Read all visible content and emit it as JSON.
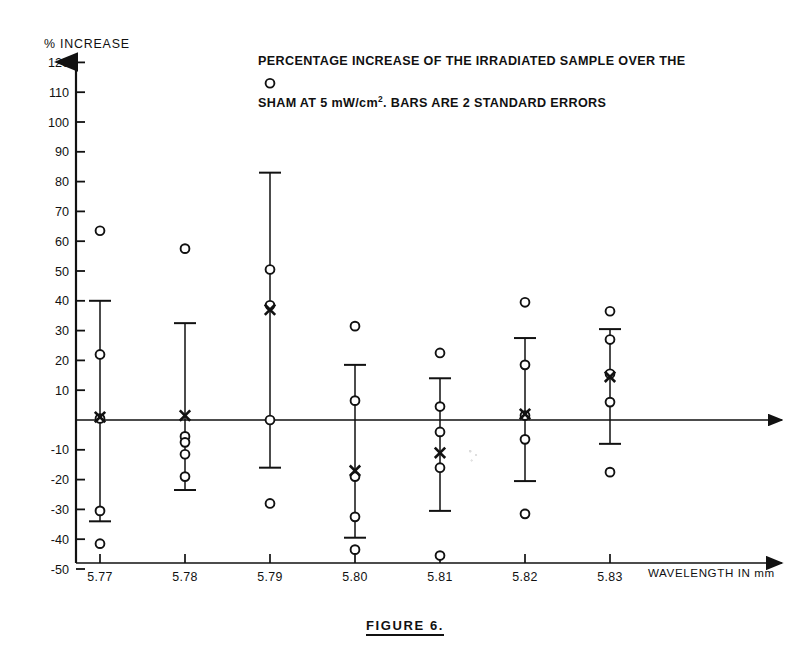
{
  "title": {
    "line1": "PERCENTAGE INCREASE OF THE IRRADIATED SAMPLE OVER THE",
    "line2_pre": "SHAM AT 5 mW/cm",
    "line2_sup": "2",
    "line2_post": ".   BARS ARE 2 STANDARD ERRORS"
  },
  "caption": "FIGURE 6.",
  "axis": {
    "y_label": "% INCREASE",
    "x_label": "WAVELENGTH IN mm"
  },
  "chart_data": {
    "type": "scatter",
    "title": "PERCENTAGE INCREASE OF THE IRRADIATED SAMPLE OVER THE SHAM AT 5 mW/cm2. BARS ARE 2 STANDARD ERRORS",
    "xlabel": "WAVELENGTH IN mm",
    "ylabel": "% INCREASE",
    "categories": [
      "5.77",
      "5.78",
      "5.79",
      "5.80",
      "5.81",
      "5.82",
      "5.83"
    ],
    "ylim": [
      -50,
      120
    ],
    "yticks": [
      120,
      110,
      100,
      90,
      80,
      70,
      60,
      50,
      40,
      30,
      20,
      10,
      0,
      -10,
      -20,
      -30,
      -40,
      -50
    ],
    "ytick_labels": [
      "120",
      "110",
      "100",
      "90",
      "80",
      "70",
      "60",
      "50",
      "40",
      "30",
      "20",
      "10",
      "",
      "-10",
      "-20",
      "-30",
      "-40",
      "-50"
    ],
    "grid": false,
    "legend": false,
    "zero_line": 0,
    "marker_note": "open circles = individual observations; X = mean; vertical bar with caps = 2 standard errors",
    "groups": [
      {
        "x": "5.77",
        "mean": 1.0,
        "err_low": -34.0,
        "err_high": 40.0,
        "points": [
          63.5,
          22.0,
          0.5,
          -30.5,
          -41.5
        ]
      },
      {
        "x": "5.78",
        "mean": 1.5,
        "err_low": -23.5,
        "err_high": 32.5,
        "points": [
          57.5,
          -5.5,
          -7.5,
          -11.5,
          -19.0
        ]
      },
      {
        "x": "5.79",
        "mean": 37.0,
        "err_low": -16.0,
        "err_high": 83.0,
        "points": [
          113.0,
          50.5,
          38.5,
          0.0,
          -28.0
        ]
      },
      {
        "x": "5.80",
        "mean": -17.0,
        "err_low": -39.5,
        "err_high": 18.5,
        "points": [
          31.5,
          6.5,
          -19.0,
          -32.5,
          -43.5
        ]
      },
      {
        "x": "5.81",
        "mean": -11.0,
        "err_low": -30.5,
        "err_high": 14.0,
        "points": [
          22.5,
          4.5,
          -4.0,
          -16.0,
          -45.5
        ]
      },
      {
        "x": "5.82",
        "mean": 2.0,
        "err_low": -20.5,
        "err_high": 27.5,
        "points": [
          39.5,
          18.5,
          1.5,
          -6.5,
          -31.5
        ]
      },
      {
        "x": "5.83",
        "mean": 14.5,
        "err_low": -8.0,
        "err_high": 30.5,
        "points": [
          36.5,
          27.0,
          15.5,
          6.0,
          -17.5
        ]
      }
    ]
  }
}
